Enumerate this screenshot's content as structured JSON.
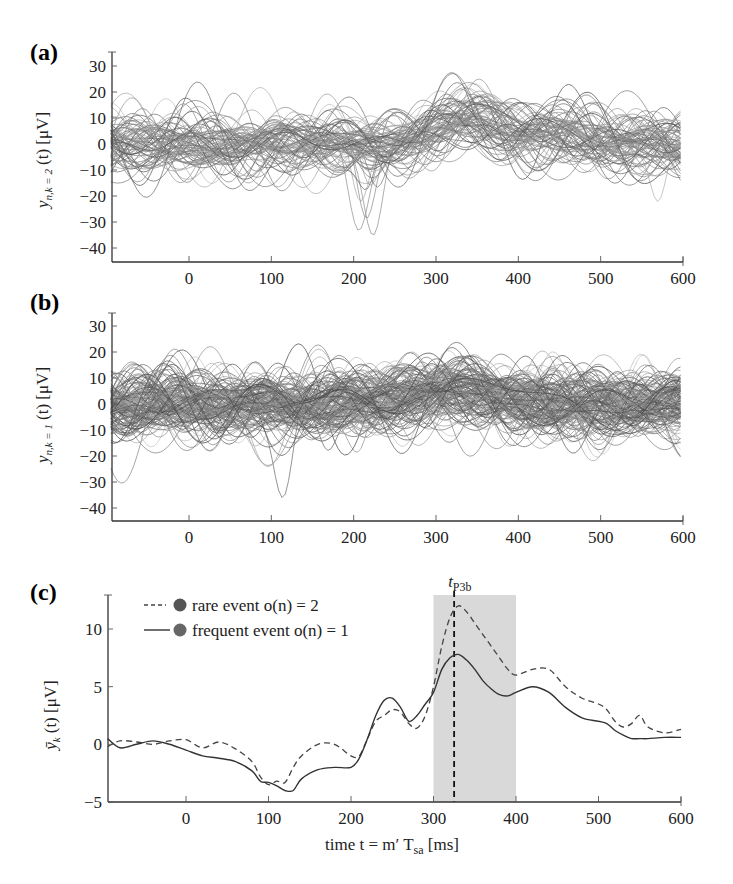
{
  "figure": {
    "panels": [
      {
        "id": "a",
        "label": "(a)",
        "ylabel_main": "y",
        "ylabel_sub": "n,k = 2",
        "ylabel_rest": "(t) [μV]"
      },
      {
        "id": "b",
        "label": "(b)",
        "ylabel_main": "y",
        "ylabel_sub": "n,k = 1",
        "ylabel_rest": "(t) [μV]"
      },
      {
        "id": "c",
        "label": "(c)",
        "ylabel_main": "ȳ",
        "ylabel_sub": "k",
        "ylabel_rest": "(t) [μV]",
        "marker_label_main": "t",
        "marker_label_sub": "P3b"
      }
    ],
    "xlabel_main": "time  t = m′ T",
    "xlabel_sub": "sa",
    "xlabel_unit": " [ms]",
    "legend": [
      {
        "label": "rare event o(n) = 2",
        "style": "dashed",
        "marker_color": "#555555"
      },
      {
        "label": "frequent event o(n) = 1",
        "style": "solid",
        "marker_color": "#666666"
      }
    ]
  },
  "chart_data": [
    {
      "type": "line",
      "panel": "(a)",
      "title": "",
      "description": "Single-trial EEG traces, rare event k = 2 (~80 overlaid trials)",
      "xlabel": "",
      "ylabel": "y_{n,k=2}(t) [μV]",
      "xlim": [
        -95,
        600
      ],
      "ylim": [
        -45,
        35
      ],
      "xticks": [
        0,
        100,
        200,
        300,
        400,
        500,
        600
      ],
      "yticks": [
        -40,
        -30,
        -20,
        -10,
        0,
        10,
        20,
        30
      ],
      "n_traces": 80,
      "features": {
        "negative_peak": {
          "x": 218,
          "y": -40
        },
        "positive_peak": {
          "x": 328,
          "y": 33
        },
        "outlier_dip": {
          "x": 570,
          "y": -29
        }
      },
      "grid": false
    },
    {
      "type": "line",
      "panel": "(b)",
      "title": "",
      "description": "Single-trial EEG traces, frequent event k = 1 (~150 overlaid trials)",
      "xlabel": "",
      "ylabel": "y_{n,k=1}(t) [μV]",
      "xlim": [
        -95,
        600
      ],
      "ylim": [
        -45,
        35
      ],
      "xticks": [
        0,
        100,
        200,
        300,
        400,
        500,
        600
      ],
      "yticks": [
        -40,
        -30,
        -20,
        -10,
        0,
        10,
        20,
        30
      ],
      "n_traces": 150,
      "features": {
        "negative_peak": {
          "x": 115,
          "y": -42
        },
        "positive_peak": {
          "x": 330,
          "y": 30
        }
      },
      "grid": false
    },
    {
      "type": "line",
      "panel": "(c)",
      "title": "",
      "xlabel": "time t = m′T_sa [ms]",
      "ylabel": "ȳ_k(t) [μV]",
      "xlim": [
        -95,
        600
      ],
      "ylim": [
        -5,
        13
      ],
      "xticks": [
        0,
        100,
        200,
        300,
        400,
        500,
        600
      ],
      "yticks": [
        -5,
        0,
        5,
        10
      ],
      "shaded_region": {
        "x0": 300,
        "x1": 400,
        "color": "#d9d9d9"
      },
      "vline": {
        "x": 325,
        "label": "t_P3b",
        "style": "dashed"
      },
      "legend_position": "upper left",
      "x": [
        -95,
        -80,
        -60,
        -40,
        -20,
        0,
        20,
        40,
        60,
        80,
        90,
        100,
        110,
        120,
        130,
        140,
        160,
        180,
        200,
        210,
        220,
        230,
        240,
        250,
        260,
        270,
        280,
        290,
        300,
        310,
        320,
        330,
        340,
        350,
        360,
        370,
        380,
        390,
        400,
        420,
        440,
        460,
        480,
        500,
        510,
        520,
        530,
        540,
        550,
        560,
        580,
        600
      ],
      "series": [
        {
          "name": "rare event o(n) = 2",
          "style": "dashed",
          "values": [
            -0.2,
            0.3,
            0.2,
            0.0,
            0.3,
            0.4,
            -0.3,
            0.2,
            -0.4,
            -1.5,
            -2.8,
            -3.5,
            -3.2,
            -3.3,
            -2.0,
            -1.0,
            0.0,
            0.0,
            -1.0,
            -1.0,
            0.5,
            2.0,
            2.5,
            3.0,
            2.8,
            1.8,
            1.4,
            2.5,
            5.0,
            8.5,
            11.0,
            12.0,
            11.5,
            10.5,
            9.5,
            8.5,
            7.5,
            6.5,
            6.0,
            6.5,
            6.5,
            5.0,
            4.0,
            3.5,
            3.0,
            2.0,
            1.5,
            1.8,
            2.5,
            1.5,
            1.0,
            1.3
          ]
        },
        {
          "name": "frequent event o(n) = 1",
          "style": "solid",
          "values": [
            0.5,
            -0.3,
            0.0,
            0.3,
            0.0,
            -0.5,
            -1.0,
            -1.2,
            -1.5,
            -2.3,
            -3.2,
            -3.3,
            -3.6,
            -4.0,
            -4.0,
            -3.0,
            -2.2,
            -2.0,
            -2.0,
            -1.2,
            0.5,
            2.5,
            3.8,
            4.0,
            3.2,
            2.0,
            2.5,
            3.5,
            4.5,
            6.5,
            7.5,
            7.8,
            7.3,
            6.5,
            5.5,
            4.8,
            4.3,
            4.2,
            4.5,
            5.0,
            4.5,
            3.2,
            2.3,
            2.0,
            1.8,
            1.2,
            0.8,
            0.5,
            0.5,
            0.5,
            0.6,
            0.6
          ]
        }
      ],
      "grid": false
    }
  ]
}
